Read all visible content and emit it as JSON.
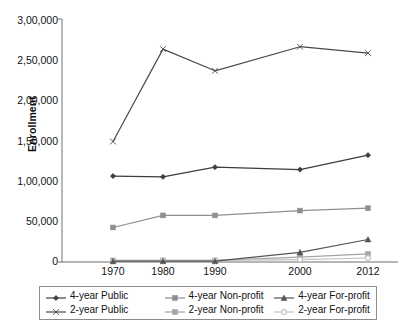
{
  "chart_data": {
    "type": "line",
    "title": "",
    "xlabel": "",
    "ylabel": "Enrollment",
    "categories": [
      "1970",
      "1980",
      "1990",
      "2000",
      "2012"
    ],
    "ylim": [
      0,
      300000
    ],
    "ytick_labels": [
      "3,00,000",
      "2,50,000",
      "2,00,000",
      "1,50,000",
      "1,00,000",
      "50,000",
      "0"
    ],
    "ytick_values": [
      300000,
      250000,
      200000,
      150000,
      100000,
      50000,
      0
    ],
    "grid": false,
    "legend_position": "bottom",
    "number_format": "indian",
    "series": [
      {
        "name": "4-year Public",
        "marker": "diamond",
        "color": "#3d3d3d",
        "values": [
          107000,
          106000,
          118000,
          115000,
          133000
        ]
      },
      {
        "name": "2-year Public",
        "marker": "x",
        "color": "#4a4a4a",
        "values": [
          150000,
          265000,
          238000,
          268000,
          260000
        ]
      },
      {
        "name": "4-year Non-profit",
        "marker": "square",
        "color": "#8f8f8f",
        "values": [
          43000,
          58000,
          58000,
          64000,
          67000
        ]
      },
      {
        "name": "2-year Non-profit",
        "marker": "square",
        "color": "#a5a5a5",
        "values": [
          2000,
          2000,
          2000,
          6000,
          10000
        ]
      },
      {
        "name": "4-year For-profit",
        "marker": "triangle",
        "color": "#555555",
        "values": [
          1000,
          1000,
          1000,
          12000,
          28000
        ]
      },
      {
        "name": "2-year For-profit",
        "marker": "circle",
        "color": "#c2c2c2",
        "values": [
          1000,
          2000,
          2000,
          3000,
          5000
        ]
      }
    ],
    "legend": [
      {
        "label": "4-year Public",
        "marker": "diamond",
        "color": "#3d3d3d"
      },
      {
        "label": "4-year Non-profit",
        "marker": "square",
        "color": "#8f8f8f"
      },
      {
        "label": "4-year For-profit",
        "marker": "triangle",
        "color": "#555555"
      },
      {
        "label": "2-year Public",
        "marker": "x",
        "color": "#4a4a4a"
      },
      {
        "label": "2-year Non-profit",
        "marker": "square",
        "color": "#a5a5a5"
      },
      {
        "label": "2-year For-profit",
        "marker": "circle",
        "color": "#c2c2c2"
      }
    ]
  }
}
